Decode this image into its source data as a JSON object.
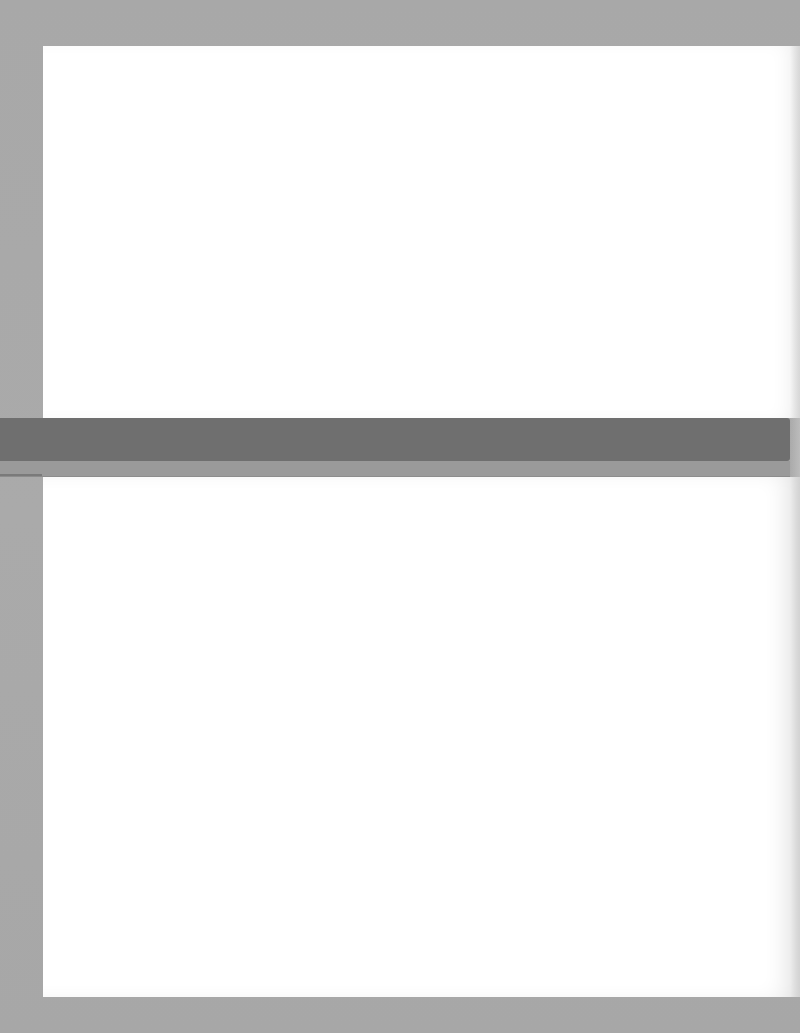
{
  "scan": {
    "description": "Blank scanned page",
    "background_color": "#a9a9a9",
    "page_color": "#ffffff",
    "band_dark_color": "#6f6f6f",
    "band_light_color": "#9a9a9a"
  },
  "text": {
    "top_region": "",
    "bottom_region": ""
  }
}
